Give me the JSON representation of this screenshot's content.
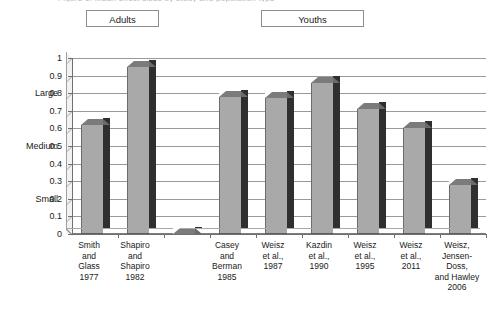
{
  "title_remnant": "Figure 1. Mean effect sizes by study and population type",
  "groups": [
    {
      "name": "adults",
      "label": "Adults"
    },
    {
      "name": "youths",
      "label": "Youths"
    }
  ],
  "axis": {
    "y_ticks": [
      "1",
      "0.9",
      "0.8",
      "0.7",
      "0.6",
      "0.5",
      "0.4",
      "0.3",
      "0.2",
      "0.1",
      "0"
    ],
    "magnitude_labels": [
      {
        "at": "0.8",
        "label": "Large"
      },
      {
        "at": "0.5",
        "label": "Medium"
      },
      {
        "at": "0.2",
        "label": "Small"
      }
    ]
  },
  "chart_data": {
    "type": "bar",
    "title": "",
    "subtitle": "",
    "xlabel": "",
    "ylabel": "",
    "ylim": [
      0,
      1
    ],
    "ytick_values": [
      0,
      0.1,
      0.2,
      0.3,
      0.4,
      0.5,
      0.6,
      0.7,
      0.8,
      0.9,
      1
    ],
    "grid": true,
    "legend": "none",
    "style": "3d-column",
    "categories": [
      "Smith and Glass 1977",
      "Shapiro and Shapiro 1982",
      "",
      "Casey and Berman 1985",
      "Weisz et al., 1987",
      "Kazdin et al., 1990",
      "Weisz et al., 1995",
      "Weisz et al., 2011",
      "Weisz, Jensen-Doss, and Hawley 2006"
    ],
    "values": [
      0.62,
      0.95,
      0,
      0.78,
      0.77,
      0.86,
      0.71,
      0.6,
      0.28
    ],
    "group_of": [
      "Adults",
      "Adults",
      "",
      "Youths",
      "Youths",
      "Youths",
      "Youths",
      "Youths",
      "Youths"
    ],
    "annotations": [
      {
        "text": "Large",
        "y": 0.8
      },
      {
        "text": "Medium",
        "y": 0.5
      },
      {
        "text": "Small",
        "y": 0.2
      }
    ]
  },
  "bars": [
    {
      "label_lines": [
        "Smith",
        "and",
        "Glass",
        "1977"
      ],
      "value": 0.62
    },
    {
      "label_lines": [
        "Shapiro",
        "and",
        "Shapiro",
        "1982"
      ],
      "value": 0.95
    },
    {
      "label_lines": [],
      "value": 0
    },
    {
      "label_lines": [
        "Casey",
        "and",
        "Berman",
        "1985"
      ],
      "value": 0.78
    },
    {
      "label_lines": [
        "Weisz",
        "et al.,",
        "1987"
      ],
      "value": 0.77
    },
    {
      "label_lines": [
        "Kazdin",
        "et al.,",
        "1990"
      ],
      "value": 0.86
    },
    {
      "label_lines": [
        "Weisz",
        "et al.,",
        "1995"
      ],
      "value": 0.71
    },
    {
      "label_lines": [
        "Weisz",
        "et al.,",
        "2011"
      ],
      "value": 0.6
    },
    {
      "label_lines": [
        "Weisz,",
        "Jensen-",
        "Doss,",
        "and Hawley",
        "2006"
      ],
      "value": 0.28
    }
  ],
  "colors": {
    "bar_front": "#a9a9a9",
    "bar_side": "#2f2f2f",
    "bar_top": "#7b7b7b",
    "gridline": "#9a9a9a",
    "axis": "#6f6f6f",
    "plot_background": "#ffffff",
    "text": "#1a1a1a"
  }
}
